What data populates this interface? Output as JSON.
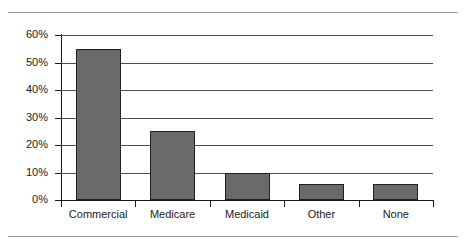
{
  "chart_data": {
    "type": "bar",
    "title": "",
    "subtitle": "",
    "xlabel": "",
    "ylabel": "",
    "categories": [
      "Commercial",
      "Medicare",
      "Medicaid",
      "Other",
      "None"
    ],
    "values": [
      55,
      25,
      10,
      6,
      6
    ],
    "value_labels": [
      "55%",
      "25%",
      "10%",
      "6%",
      "6%"
    ],
    "ylim": [
      0,
      60
    ],
    "ytick_values": [
      0,
      10,
      20,
      30,
      40,
      50,
      60
    ],
    "ytick_labels": [
      "0%",
      "10%",
      "20%",
      "30%",
      "40%",
      "50%",
      "60%"
    ],
    "grid": "horizontal",
    "legend": "none",
    "series": [
      {
        "name": "",
        "values": [
          55,
          25,
          10,
          6,
          6
        ]
      }
    ],
    "colors": {
      "bar_fill": "#6a6a6a",
      "bar_stroke": "#1f1f1f",
      "gridline": "#4d4d4d",
      "axis": "#1a1a1a",
      "text": "#1a1a1a",
      "background": "#ffffff",
      "document_rule": "#9a9a9a"
    }
  }
}
